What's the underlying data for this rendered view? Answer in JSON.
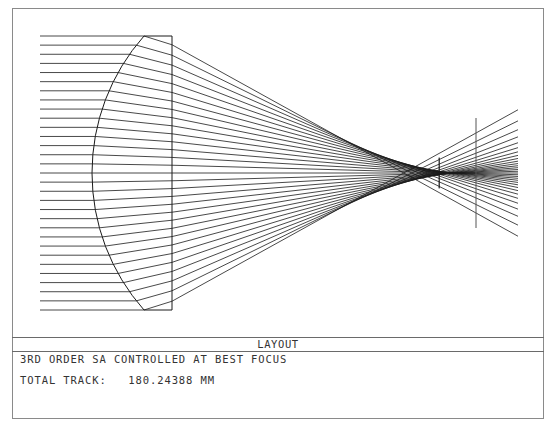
{
  "window": {
    "title": "LAYOUT"
  },
  "info": {
    "line1": "3RD ORDER SA CONTROLLED AT BEST FOCUS",
    "line2_label": "TOTAL TRACK:",
    "line2_value": "180.24388 MM",
    "line2": "TOTAL TRACK:   180.24388 MM"
  },
  "diagram": {
    "type": "optical-layout",
    "colors": {
      "ray": "#1a1a1a",
      "lens": "#1a1a1a",
      "frame": "#8a8a8a",
      "image_plane": "#555555"
    },
    "axis_y": 173,
    "rays": {
      "count": 31,
      "start_x": 40,
      "top_y": 36,
      "bottom_y": 310,
      "end_x": 518
    },
    "lens": {
      "shape": "plano-convex",
      "front_vertex_x": 92,
      "edge_x": 144,
      "flat_x": 172,
      "top_y": 36,
      "bottom_y": 310,
      "refractive_index": 1.62
    },
    "aperture_box": {
      "x": 439,
      "top_y": 158,
      "bottom_y": 188
    },
    "image_plane": {
      "x": 476,
      "top_y": 118,
      "bottom_y": 228
    }
  }
}
